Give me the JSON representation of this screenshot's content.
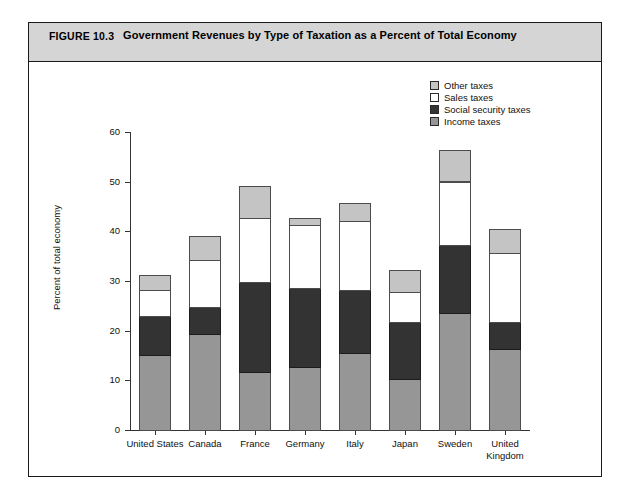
{
  "figure": {
    "number_label": "FIGURE 10.3",
    "title": "Government Revenues by Type of Taxation as a Percent of Total Economy"
  },
  "legend": {
    "position": "top-right",
    "entries": [
      {
        "label": "Other taxes",
        "color": "#c4c4c4",
        "key": "other"
      },
      {
        "label": "Sales taxes",
        "color": "#ffffff",
        "key": "sales"
      },
      {
        "label": "Social security taxes",
        "color": "#333333",
        "key": "social"
      },
      {
        "label": "Income taxes",
        "color": "#969696",
        "key": "income"
      }
    ]
  },
  "axes": {
    "ylabel": "Percent of total economy",
    "yticks": [
      "0",
      "10",
      "20",
      "30",
      "40",
      "50",
      "60"
    ],
    "xlabel": ""
  },
  "chart_data": {
    "type": "bar",
    "stacked": true,
    "title": "Government Revenues by Type of Taxation as a Percent of Total Economy",
    "xlabel": "",
    "ylabel": "Percent of total economy",
    "ylim": [
      0,
      60
    ],
    "ytick_step": 10,
    "grid": false,
    "legend_position": "top-right",
    "categories": [
      "United States",
      "Canada",
      "France",
      "Germany",
      "Italy",
      "Japan",
      "Sweden",
      "United Kingdom"
    ],
    "category_lines": [
      [
        "United States"
      ],
      [
        "Canada"
      ],
      [
        "France"
      ],
      [
        "Germany"
      ],
      [
        "Italy"
      ],
      [
        "Japan"
      ],
      [
        "Sweden"
      ],
      [
        "United",
        "Kingdom"
      ]
    ],
    "series": [
      {
        "name": "Income taxes",
        "color": "#969696",
        "values": [
          15.1,
          19.3,
          11.7,
          12.6,
          15.4,
          10.2,
          23.6,
          16.3
        ]
      },
      {
        "name": "Social security taxes",
        "color": "#333333",
        "values": [
          7.8,
          5.5,
          18.1,
          16.0,
          12.8,
          11.6,
          13.6,
          5.5
        ]
      },
      {
        "name": "Sales taxes",
        "color": "#ffffff",
        "values": [
          5.2,
          9.5,
          12.9,
          12.6,
          13.8,
          6.0,
          12.8,
          13.8
        ]
      },
      {
        "name": "Other taxes",
        "color": "#c4c4c4",
        "values": [
          3.1,
          4.7,
          6.3,
          1.5,
          3.6,
          4.3,
          6.3,
          4.8
        ]
      }
    ],
    "totals": [
      31.2,
      39.0,
      49.0,
      42.7,
      45.6,
      32.1,
      56.3,
      40.4
    ]
  },
  "geometry": {
    "baseline_y": 430,
    "px_per_unit": 4.97,
    "bar_width": 32,
    "bar_left_positions": [
      139,
      189,
      239,
      289,
      339,
      389,
      439,
      489
    ]
  }
}
